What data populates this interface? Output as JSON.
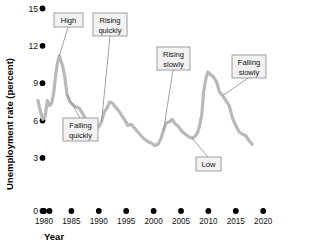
{
  "chart_data": {
    "type": "line",
    "title": "",
    "xlabel": "Year",
    "ylabel": "Unemployment rate (percent)",
    "xlim": [
      1978,
      2021
    ],
    "ylim": [
      0,
      15
    ],
    "xticks": [
      1980,
      1985,
      1990,
      1995,
      2000,
      2005,
      2010,
      2015,
      2020
    ],
    "yticks": [
      0,
      3,
      6,
      9,
      12,
      15
    ],
    "grid": false,
    "legend": "none",
    "series": [
      {
        "name": "Unemployment rate",
        "color": "#b9b9b9",
        "x": [
          1978.9,
          1979.3,
          1979.8,
          1980.2,
          1980.6,
          1981.0,
          1981.4,
          1981.8,
          1982.1,
          1982.4,
          1982.8,
          1983.1,
          1983.4,
          1983.8,
          1984.2,
          1984.7,
          1985.2,
          1985.8,
          1986.4,
          1987.0,
          1987.6,
          1988.2,
          1988.9,
          1989.5,
          1990.0,
          1990.5,
          1991.0,
          1991.5,
          1992.0,
          1992.5,
          1993.0,
          1993.6,
          1994.2,
          1994.8,
          1995.3,
          1995.9,
          1996.5,
          1997.1,
          1997.7,
          1998.3,
          1999.0,
          1999.6,
          2000.2,
          2000.8,
          2001.3,
          2001.8,
          2002.3,
          2002.9,
          2003.4,
          2004.0,
          2004.6,
          2005.2,
          2005.8,
          2006.4,
          2007.0,
          2007.5,
          2008.0,
          2008.4,
          2008.8,
          2009.1,
          2009.5,
          2009.9,
          2010.4,
          2010.9,
          2011.5,
          2012.0,
          2012.6,
          2013.2,
          2013.8,
          2014.4,
          2015.0,
          2015.6,
          2016.2,
          2016.8,
          2017.4,
          2018.0
        ],
        "y": [
          7.6,
          6.8,
          6.1,
          6.3,
          7.6,
          7.2,
          7.4,
          8.3,
          9.6,
          10.5,
          11.2,
          10.8,
          10.4,
          9.5,
          8.1,
          7.5,
          7.3,
          7.1,
          7.0,
          6.6,
          6.1,
          5.6,
          5.4,
          5.3,
          5.5,
          5.9,
          6.7,
          7.0,
          7.5,
          7.4,
          7.1,
          6.8,
          6.4,
          6.0,
          5.6,
          5.7,
          5.4,
          5.1,
          4.8,
          4.5,
          4.3,
          4.2,
          4.0,
          4.1,
          4.5,
          5.2,
          5.8,
          5.9,
          6.1,
          5.7,
          5.5,
          5.1,
          4.9,
          4.7,
          4.6,
          4.7,
          5.0,
          5.6,
          6.5,
          8.2,
          9.3,
          9.9,
          9.7,
          9.5,
          9.1,
          8.3,
          8.0,
          7.6,
          7.2,
          6.2,
          5.6,
          5.1,
          4.9,
          4.8,
          4.4,
          4.1
        ],
        "annotations_note": "values estimated from plotted curve"
      }
    ],
    "callouts": [
      {
        "label": "High",
        "text_lines": [
          "High"
        ],
        "points_to_year": 1982.8,
        "points_to_value": 11.2
      },
      {
        "label": "Rising quickly",
        "text_lines": [
          "Rising",
          "quickly"
        ],
        "points_to_year": 1990.5,
        "points_to_value": 5.9
      },
      {
        "label": "Rising slowly",
        "text_lines": [
          "Rising",
          "slowly"
        ],
        "points_to_year": 2001.8,
        "points_to_value": 5.2
      },
      {
        "label": "Falling slowly",
        "text_lines": [
          "Falling",
          "slowly"
        ],
        "points_to_year": 2012.6,
        "points_to_value": 8.0
      },
      {
        "label": "Falling quickly",
        "text_lines": [
          "Falling",
          "quickly"
        ],
        "points_to_year": 1984.2,
        "points_to_value": 8.1
      },
      {
        "label": "Low",
        "text_lines": [
          "Low"
        ],
        "points_to_year": 2007.0,
        "points_to_value": 4.6
      }
    ]
  },
  "axis": {
    "ylabel": "Unemployment rate (percent)",
    "xlabel": "Year",
    "ytick_labels": [
      "15",
      "12",
      "9",
      "6",
      "3",
      "0"
    ],
    "xtick_labels": [
      "1980",
      "1985",
      "1990",
      "1995",
      "2000",
      "2005",
      "2010",
      "2015",
      "2020"
    ]
  },
  "style": {
    "line_color": "#b9b9b9",
    "tick_dot_color": "#000000",
    "callout_fill": "#f2f2f2",
    "callout_stroke": "#888888",
    "background": "#ffffff"
  }
}
